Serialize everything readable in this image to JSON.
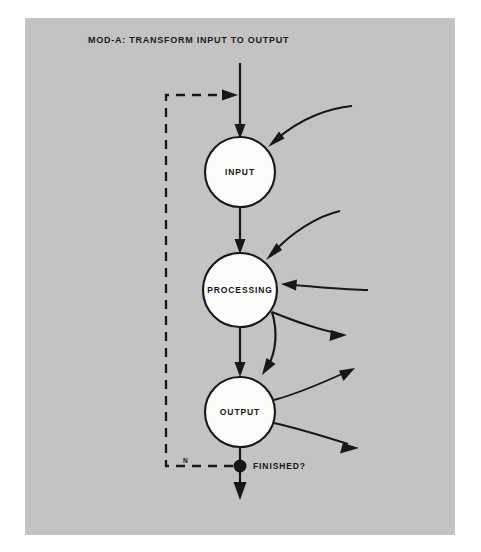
{
  "diagram": {
    "title": "MOD-A: TRANSFORM INPUT TO OUTPUT",
    "background_color": "#c3c3c3",
    "page_color": "#ffffff",
    "ink_color": "#17171b",
    "node_fill": "#fbfbf9",
    "nodes": [
      {
        "id": "input",
        "label": "INPUT"
      },
      {
        "id": "processing",
        "label": "PROCESSING"
      },
      {
        "id": "output",
        "label": "OUTPUT"
      }
    ],
    "decision": {
      "label": "FINISHED?",
      "branch_no_label": "N"
    }
  }
}
